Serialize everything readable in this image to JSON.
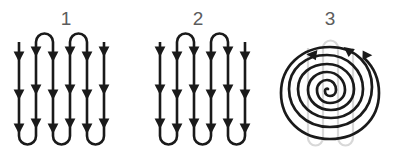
{
  "figure": {
    "title": "",
    "background_color": "#ffffff",
    "stroke_color": "#1a1a1a",
    "ghost_color": "#d8d8d8",
    "label_color": "#5c5c5c",
    "panel_count": 3
  },
  "panels": [
    {
      "label": "1",
      "pattern_name": "serpentine-raster-top-start",
      "description": "Vertical serpentine (zig-zag) scan path with U-turns at top and bottom",
      "icon": "serpentine-path-icon",
      "pass_count": 5,
      "arrow_rows": 3,
      "direction_first_pass": "down",
      "turn_caps_top": 4,
      "turn_caps_bottom": 4,
      "open_end_side": "right"
    },
    {
      "label": "2",
      "pattern_name": "serpentine-raster-bottom-start",
      "description": "Vertical serpentine scan path mirrored, first pass upward",
      "icon": "serpentine-path-icon",
      "pass_count": 5,
      "arrow_rows": 3,
      "direction_first_pass": "up",
      "turn_caps_top": 4,
      "turn_caps_bottom": 4,
      "open_end_side": "left"
    },
    {
      "label": "3",
      "pattern_name": "spiral-path",
      "description": "Inward counter-clockwise spiral scan path over a serpentine underlay",
      "icon": "spiral-path-icon",
      "turn_count": 4,
      "direction": "counter-clockwise",
      "arrowheads": 3,
      "has_ghost_underlay": true,
      "ghost_pattern": "serpentine-raster"
    }
  ]
}
